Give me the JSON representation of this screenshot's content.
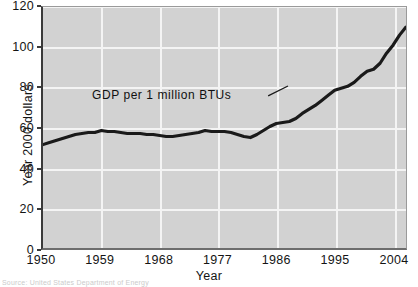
{
  "chart_data": {
    "type": "line",
    "title": "",
    "xlabel": "Year",
    "ylabel": "Year 2000 dollars",
    "xlim": [
      1950,
      2006
    ],
    "ylim": [
      0,
      120
    ],
    "grid": true,
    "legend": "none",
    "xticks": [
      "1950",
      "1959",
      "1968",
      "1977",
      "1986",
      "1995",
      "2004"
    ],
    "xtick_values": [
      1950,
      1959,
      1968,
      1977,
      1986,
      1995,
      2004
    ],
    "yticks": [
      "0",
      "20",
      "40",
      "60",
      "80",
      "100",
      "120"
    ],
    "ytick_values": [
      0,
      20,
      40,
      60,
      80,
      100,
      120
    ],
    "series": [
      {
        "name": "GDP per 1 million BTUs",
        "x": [
          1950,
          1951,
          1952,
          1953,
          1954,
          1955,
          1956,
          1957,
          1958,
          1959,
          1960,
          1961,
          1962,
          1963,
          1964,
          1965,
          1966,
          1967,
          1968,
          1969,
          1970,
          1971,
          1972,
          1973,
          1974,
          1975,
          1976,
          1977,
          1978,
          1979,
          1980,
          1981,
          1982,
          1983,
          1984,
          1985,
          1986,
          1987,
          1988,
          1989,
          1990,
          1991,
          1992,
          1993,
          1994,
          1995,
          1996,
          1997,
          1998,
          1999,
          2000,
          2001,
          2002,
          2003,
          2004,
          2005,
          2006
        ],
        "values": [
          51.5,
          52.5,
          53.5,
          54.5,
          55.5,
          56.5,
          57.0,
          57.5,
          57.5,
          58.5,
          58.0,
          58.0,
          57.5,
          57.0,
          57.0,
          57.0,
          56.5,
          56.5,
          56.0,
          55.5,
          55.5,
          56.0,
          56.5,
          57.0,
          57.5,
          58.5,
          58.0,
          58.0,
          58.0,
          57.5,
          56.5,
          55.5,
          55.0,
          56.5,
          58.5,
          60.5,
          62.0,
          62.5,
          63.0,
          64.5,
          67.0,
          69.0,
          71.0,
          73.5,
          76.0,
          78.5,
          79.5,
          80.5,
          82.5,
          85.5,
          88.0,
          89.0,
          92.0,
          97.0,
          101.0,
          106.0,
          110.0
        ]
      }
    ],
    "annotations": [
      {
        "text": "GDP per 1 million BTUs",
        "x": 1967,
        "y": 76
      }
    ]
  },
  "axes": {
    "ylabel": "Year 2000 dollars",
    "xlabel": "Year"
  },
  "footer": {
    "source": "Source: United States Department of Energy"
  }
}
